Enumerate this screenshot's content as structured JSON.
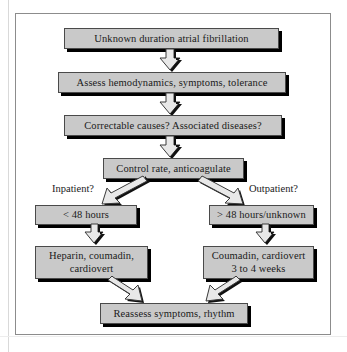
{
  "diagram": {
    "colors": {
      "box_fill": "#c9c9c9",
      "box_border": "#4a4a4a",
      "box_shadow": "#000000",
      "arrow_face": "#e8e8e8",
      "arrow_outline": "#3a3a3a",
      "frame_border": "#8c8c8c",
      "background": "#ffffff"
    },
    "nodes": [
      {
        "id": "start",
        "label": "Unknown duration atrial fibrillation"
      },
      {
        "id": "assess",
        "label": "Assess hemodynamics, symptoms, tolerance"
      },
      {
        "id": "correctable",
        "label": "Correctable causes? Associated diseases?"
      },
      {
        "id": "control",
        "label": "Control rate, anticoagulate"
      },
      {
        "id": "lt48",
        "label": "< 48 hours"
      },
      {
        "id": "gt48",
        "label": "> 48 hours/unknown"
      },
      {
        "id": "heparin_l1",
        "label": "Heparin, coumadin,"
      },
      {
        "id": "heparin_l2",
        "label": "cardiovert"
      },
      {
        "id": "coumadin_l1",
        "label": "Coumadin, cardiovert"
      },
      {
        "id": "coumadin_l2",
        "label": "3 to 4 weeks"
      },
      {
        "id": "reassess",
        "label": "Reassess symptoms, rhythm"
      }
    ],
    "branch_labels": {
      "inpatient": "Inpatient?",
      "outpatient": "Outpatient?"
    },
    "arrows": [
      {
        "id": "start-to-assess",
        "direction": "down"
      },
      {
        "id": "assess-to-correctable",
        "direction": "down"
      },
      {
        "id": "correctable-to-control",
        "direction": "down"
      },
      {
        "id": "control-to-lt48",
        "direction": "down-left"
      },
      {
        "id": "control-to-gt48",
        "direction": "down-right"
      },
      {
        "id": "lt48-to-heparin",
        "direction": "down"
      },
      {
        "id": "gt48-to-coumadin",
        "direction": "down"
      },
      {
        "id": "heparin-to-reassess",
        "direction": "down-right"
      },
      {
        "id": "coumadin-to-reassess",
        "direction": "down-left"
      }
    ]
  }
}
